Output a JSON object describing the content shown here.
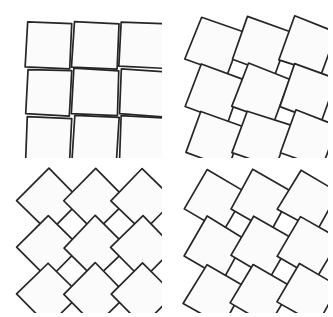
{
  "figure": {
    "background_color": "#ffffff",
    "stroke_color": "#262626",
    "fill_color": "#fbfbfb",
    "stroke_width": 1.7,
    "canvas": {
      "width": 333,
      "height": 317
    }
  },
  "panels": [
    {
      "id": "panel-top-left",
      "name": "stage-1-slight-twist",
      "position": {
        "x": 10,
        "y": 8,
        "width": 152,
        "height": 150
      },
      "grid": {
        "rows": 3,
        "cols": 3
      },
      "rotation_degrees": 3,
      "gap_shape": "thin-slit",
      "lattice_spacing": 47,
      "square_side": 45,
      "origin": {
        "x": 16,
        "y": 15
      },
      "jitter": 0.9
    },
    {
      "id": "panel-top-right",
      "name": "stage-2-medium-twist",
      "position": {
        "x": 176,
        "y": 8,
        "width": 152,
        "height": 150
      },
      "grid": {
        "rows": 3,
        "cols": 3
      },
      "rotation_degrees": 20,
      "gap_shape": "wide-rhombus",
      "lattice_spacing": 47,
      "square_side": 45,
      "origin": {
        "x": 16,
        "y": 15
      },
      "jitter": 0.9
    },
    {
      "id": "panel-bottom-left",
      "name": "stage-4-full-twist-diamond-grid",
      "position": {
        "x": 10,
        "y": 163,
        "width": 152,
        "height": 150
      },
      "grid": {
        "rows": 3,
        "cols": 3
      },
      "rotation_degrees": 45,
      "gap_shape": "closed",
      "lattice_spacing": 47,
      "square_side": 45,
      "origin": {
        "x": 16,
        "y": 15
      },
      "jitter": 0.6
    },
    {
      "id": "panel-bottom-right",
      "name": "stage-3-large-twist",
      "position": {
        "x": 176,
        "y": 163,
        "width": 152,
        "height": 150
      },
      "grid": {
        "rows": 3,
        "cols": 3
      },
      "rotation_degrees": 30,
      "gap_shape": "narrow-rhombus",
      "lattice_spacing": 47,
      "square_side": 45,
      "origin": {
        "x": 16,
        "y": 15
      },
      "jitter": 0.9
    }
  ]
}
